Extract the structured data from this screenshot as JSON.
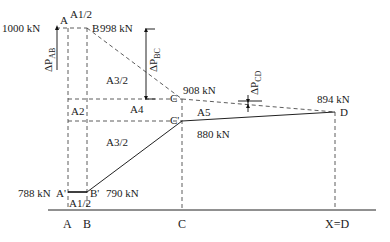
{
  "diagram": {
    "title": "",
    "points": {
      "A": {
        "label": "A",
        "value": "1000 kN"
      },
      "B": {
        "label": "B",
        "value": "998 kN"
      },
      "C": {
        "label": "C",
        "value": "908 kN"
      },
      "C_prime": {
        "label": "C'",
        "value": "880 kN"
      },
      "D": {
        "label": "D",
        "value": "894 kN"
      },
      "A_prime": {
        "label": "A'",
        "value": "788 kN"
      },
      "B_prime": {
        "label": "B'",
        "value": "790 kN"
      }
    },
    "areas": {
      "a1_top": "A1/2",
      "a1_bottom": "A1/2",
      "a2": "A2",
      "a3_top": "A3/2",
      "a3_bottom": "A3/2",
      "a4": "A4",
      "a5": "A5"
    },
    "deltas": {
      "ab": {
        "prefix": "ΔP",
        "sub": "AB"
      },
      "bc": {
        "prefix": "ΔP",
        "sub": "BC"
      },
      "cd": {
        "prefix": "ΔP",
        "sub": "CD"
      }
    },
    "axis_labels": [
      "A",
      "B",
      "C",
      "X=D"
    ]
  }
}
